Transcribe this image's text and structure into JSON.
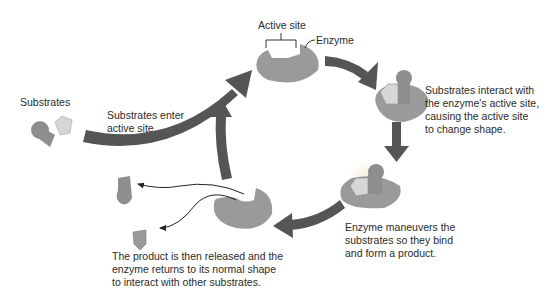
{
  "labels": {
    "substrates": "Substrates",
    "active_site": "Active site",
    "enzyme": "Enzyme",
    "step1": "Substrates enter\nactive site.",
    "step2": "Substrates interact with\nthe enzyme's active site,\ncausing the active site\nto change shape.",
    "step3": "Enzyme maneuvers the\nsubstrates so they bind\nand form a product.",
    "step4": "The product is then released and the\nenzyme returns to its normal shape\nto interact with other substrates."
  },
  "colors": {
    "enzyme": "#9a9a9a",
    "substrate_dark": "#8e8e8e",
    "substrate_light": "#d6d6d6",
    "arrow": "#555555",
    "text": "#2b2b2b"
  },
  "nodes": [
    {
      "id": "free-substrates",
      "label": "Substrates"
    },
    {
      "id": "enzyme-empty",
      "label": "Enzyme with active site"
    },
    {
      "id": "enzyme-substrate-complex",
      "label": "Substrates interact with active site"
    },
    {
      "id": "enzyme-product-complex",
      "label": "Enzyme forms product"
    },
    {
      "id": "enzyme-released",
      "label": "Product released"
    }
  ],
  "edges": [
    {
      "from": "free-substrates",
      "to": "enzyme-empty",
      "label": "Substrates enter active site."
    },
    {
      "from": "enzyme-empty",
      "to": "enzyme-substrate-complex"
    },
    {
      "from": "enzyme-substrate-complex",
      "to": "enzyme-product-complex"
    },
    {
      "from": "enzyme-product-complex",
      "to": "enzyme-released"
    },
    {
      "from": "enzyme-released",
      "to": "enzyme-empty"
    }
  ]
}
